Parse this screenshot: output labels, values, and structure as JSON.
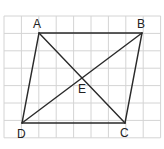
{
  "diagram": {
    "type": "parallelogram-with-diagonals",
    "grid": {
      "x0": 4,
      "y0": 16,
      "cols": 9,
      "rows": 7,
      "cell": 17.4,
      "line_color": "#d4d4d4"
    },
    "stroke_color": "#2a2a2a",
    "points": {
      "A": {
        "label": "A",
        "x": 39,
        "y": 33,
        "lx": 37,
        "ly": 28
      },
      "B": {
        "label": "B",
        "x": 142,
        "y": 33,
        "lx": 141,
        "ly": 28
      },
      "C": {
        "label": "C",
        "x": 125,
        "y": 123,
        "lx": 124,
        "ly": 137
      },
      "D": {
        "label": "D",
        "x": 22,
        "y": 123,
        "lx": 21,
        "ly": 138
      },
      "E": {
        "label": "E",
        "x": 83,
        "y": 79,
        "lx": 82,
        "ly": 93
      }
    },
    "segments": [
      [
        "A",
        "B"
      ],
      [
        "B",
        "C"
      ],
      [
        "C",
        "D"
      ],
      [
        "D",
        "A"
      ],
      [
        "A",
        "C"
      ],
      [
        "B",
        "D"
      ]
    ]
  }
}
